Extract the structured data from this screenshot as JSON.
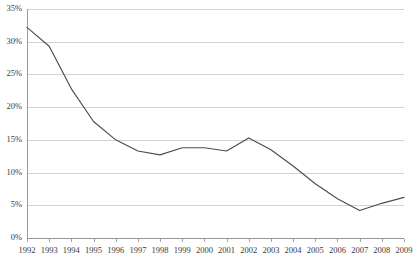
{
  "chart_data": {
    "type": "line",
    "title": "",
    "subtitle": "",
    "xlabel": "",
    "ylabel": "",
    "grid": true,
    "legend": false,
    "legend_position": "none",
    "line_color": "#4d4d4d",
    "grid_color": "#c8c8c8",
    "axis_color": "#8f8f8f",
    "background_color": "#ffffff",
    "ylim": [
      0,
      35
    ],
    "ytick_values": [
      0,
      5,
      10,
      15,
      20,
      25,
      30,
      35
    ],
    "ytick_labels": [
      "0%",
      "5%",
      "10%",
      "15%",
      "20%",
      "25%",
      "30%",
      "35%"
    ],
    "xlim": [
      1992,
      2009
    ],
    "categories": [
      "1992",
      "1993",
      "1994",
      "1995",
      "1996",
      "1997",
      "1998",
      "1999",
      "2000",
      "2001",
      "2002",
      "2003",
      "2004",
      "2005",
      "2006",
      "2007",
      "2008",
      "2009"
    ],
    "x": [
      1992,
      1993,
      1994,
      1995,
      1996,
      1997,
      1998,
      1999,
      2000,
      2001,
      2002,
      2003,
      2004,
      2005,
      2006,
      2007,
      2008,
      2009
    ],
    "values": [
      32.2,
      29.3,
      22.8,
      17.8,
      15.0,
      13.3,
      12.7,
      13.8,
      13.8,
      13.3,
      15.3,
      13.5,
      11.0,
      8.3,
      6.0,
      4.2,
      5.3,
      6.2
    ],
    "series": [
      {
        "name": "",
        "values": [
          32.2,
          29.3,
          22.8,
          17.8,
          15.0,
          13.3,
          12.7,
          13.8,
          13.8,
          13.3,
          15.3,
          13.5,
          11.0,
          8.3,
          6.0,
          4.2,
          5.3,
          6.2
        ]
      }
    ],
    "annotations": []
  },
  "plot_geometry": {
    "left": 27,
    "right": 404,
    "top": 9,
    "bottom": 238,
    "tick_length": 3,
    "xlabel_offset": 5
  }
}
